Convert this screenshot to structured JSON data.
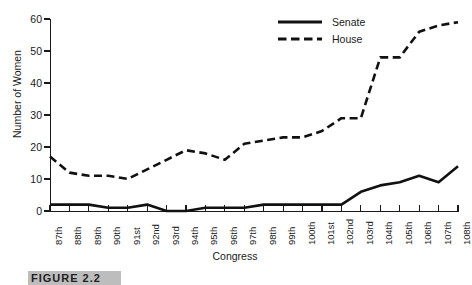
{
  "chart_data": {
    "type": "line",
    "title": "",
    "xlabel": "Congress",
    "ylabel": "Number of Women",
    "xlim": [
      0,
      21
    ],
    "ylim": [
      0,
      60
    ],
    "yticks": [
      0,
      10,
      20,
      30,
      40,
      50,
      60
    ],
    "ytick_labels": [
      "0",
      "10",
      "20",
      "30",
      "40",
      "50",
      "60"
    ],
    "grid": false,
    "legend_position": "top-right",
    "categories": [
      "87th",
      "88th",
      "89th",
      "90th",
      "91st",
      "92nd",
      "93rd",
      "94th",
      "95th",
      "96th",
      "97th",
      "98th",
      "99th",
      "100th",
      "101st",
      "102nd",
      "103rd",
      "104th",
      "105th",
      "106th",
      "107th",
      "108th"
    ],
    "series": [
      {
        "name": "Senate",
        "style": "solid",
        "color": "#111111",
        "values": [
          2,
          2,
          2,
          1,
          1,
          2,
          0,
          0,
          1,
          1,
          1,
          2,
          2,
          2,
          2,
          2,
          6,
          8,
          9,
          11,
          9,
          14
        ]
      },
      {
        "name": "House",
        "style": "dashed",
        "color": "#111111",
        "values": [
          17,
          12,
          11,
          11,
          10,
          13,
          16,
          19,
          18,
          16,
          21,
          22,
          23,
          23,
          25,
          29,
          29,
          48,
          48,
          56,
          58,
          59
        ]
      }
    ]
  },
  "legend": {
    "items": [
      {
        "label": "Senate",
        "style": "solid"
      },
      {
        "label": "House",
        "style": "dashed"
      }
    ]
  },
  "caption": {
    "text": "FIGURE 2.2"
  }
}
